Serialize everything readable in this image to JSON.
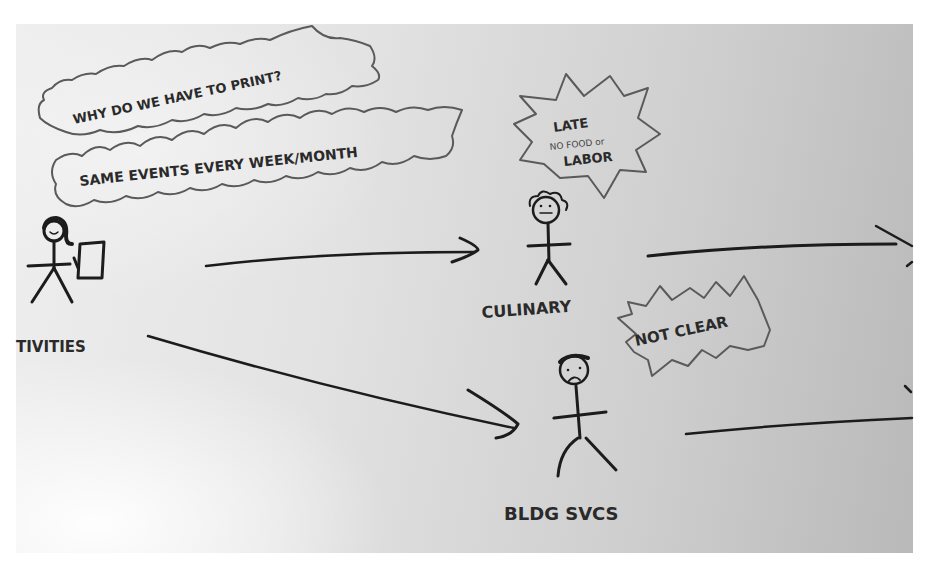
{
  "diagram": {
    "type": "hand-drawn user journey sketch",
    "background": {
      "paper_light": "#eeeeee",
      "paper_dark": "#b9b9b9",
      "ink": "#1c1c1c",
      "bubble_ink": "#5a5a5a"
    },
    "actors": [
      {
        "id": "activities",
        "label": "TIVITIES",
        "expression": "smiling",
        "holding": "paper"
      },
      {
        "id": "culinary",
        "label": "CULINARY",
        "expression": "neutral"
      },
      {
        "id": "bldg_svcs",
        "label": "BLDG SVCS",
        "expression": "frowning"
      }
    ],
    "thought_bubbles": [
      {
        "id": "why-print",
        "attached_to": "activities",
        "text": "WHY DO WE HAVE TO PRINT?"
      },
      {
        "id": "same-events",
        "attached_to": "activities",
        "text": "SAME EVENTS EVERY WEEK/MONTH"
      },
      {
        "id": "late",
        "attached_to": "culinary",
        "lines": [
          "LATE",
          "NO FOOD or",
          "LABOR"
        ]
      },
      {
        "id": "not-clear",
        "attached_to": "bldg_svcs",
        "text": "NOT CLEAR"
      }
    ],
    "edges": [
      {
        "from": "activities",
        "to": "culinary"
      },
      {
        "from": "activities",
        "to": "bldg_svcs"
      },
      {
        "from": "culinary",
        "to": "offscreen-right"
      },
      {
        "from": "bldg_svcs",
        "to": "offscreen-right"
      }
    ]
  }
}
